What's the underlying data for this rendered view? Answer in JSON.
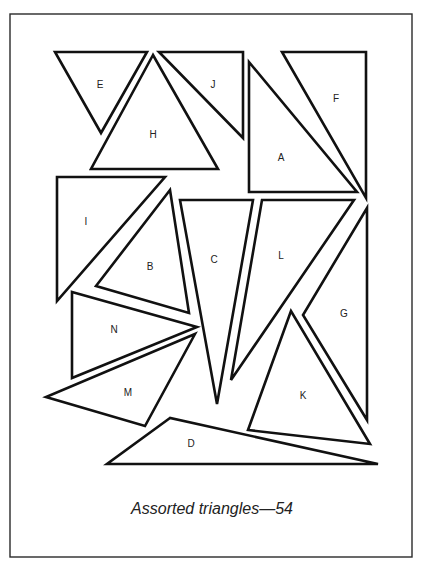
{
  "figure": {
    "caption": "Assorted triangles—54",
    "frame": {
      "x": 10,
      "y": 14,
      "width": 402,
      "height": 543
    },
    "triangles": [
      {
        "label": "E",
        "points": [
          [
            55,
            52
          ],
          [
            147,
            52
          ],
          [
            101,
            133
          ]
        ],
        "label_pos": [
          100,
          85
        ]
      },
      {
        "label": "H",
        "points": [
          [
            153,
            55
          ],
          [
            91,
            169
          ],
          [
            218,
            169
          ]
        ],
        "label_pos": [
          153,
          135
        ]
      },
      {
        "label": "J",
        "points": [
          [
            159,
            52
          ],
          [
            243,
            52
          ],
          [
            243,
            138
          ]
        ],
        "label_pos": [
          213,
          85
        ]
      },
      {
        "label": "A",
        "points": [
          [
            249,
            62
          ],
          [
            249,
            192
          ],
          [
            357,
            192
          ]
        ],
        "label_pos": [
          281,
          158
        ]
      },
      {
        "label": "F",
        "points": [
          [
            282,
            52
          ],
          [
            366,
            52
          ],
          [
            366,
            198
          ]
        ],
        "label_pos": [
          336,
          99
        ]
      },
      {
        "label": "I",
        "points": [
          [
            57,
            177
          ],
          [
            165,
            177
          ],
          [
            57,
            301
          ]
        ],
        "label_pos": [
          86,
          222
        ]
      },
      {
        "label": "B",
        "points": [
          [
            170,
            190
          ],
          [
            96,
            286
          ],
          [
            189,
            313
          ]
        ],
        "label_pos": [
          150,
          267
        ]
      },
      {
        "label": "C",
        "points": [
          [
            180,
            200
          ],
          [
            253,
            200
          ],
          [
            217,
            404
          ]
        ],
        "label_pos": [
          214,
          260
        ]
      },
      {
        "label": "L",
        "points": [
          [
            262,
            200
          ],
          [
            354,
            200
          ],
          [
            231,
            380
          ]
        ],
        "label_pos": [
          281,
          256
        ]
      },
      {
        "label": "G",
        "points": [
          [
            367,
            208
          ],
          [
            367,
            420
          ],
          [
            303,
            315
          ]
        ],
        "label_pos": [
          344,
          314
        ]
      },
      {
        "label": "N",
        "points": [
          [
            72,
            292
          ],
          [
            197,
            327
          ],
          [
            72,
            378
          ]
        ],
        "label_pos": [
          114,
          330
        ]
      },
      {
        "label": "M",
        "points": [
          [
            195,
            334
          ],
          [
            46,
            397
          ],
          [
            145,
            426
          ]
        ],
        "label_pos": [
          128,
          393
        ]
      },
      {
        "label": "K",
        "points": [
          [
            291,
            311
          ],
          [
            248,
            430
          ],
          [
            370,
            444
          ]
        ],
        "label_pos": [
          303,
          396
        ]
      },
      {
        "label": "D",
        "points": [
          [
            170,
            418
          ],
          [
            107,
            464
          ],
          [
            378,
            464
          ]
        ],
        "label_pos": [
          191,
          444
        ]
      }
    ]
  }
}
